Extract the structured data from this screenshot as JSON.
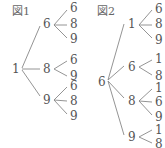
{
  "figures": [
    {
      "title": "図1",
      "root": "1",
      "branches": [
        {
          "value": "6",
          "leaves": [
            "6",
            "8",
            "9"
          ]
        },
        {
          "value": "8",
          "leaves": [
            "6",
            "9"
          ]
        },
        {
          "value": "9",
          "leaves": [
            "6",
            "8",
            "9"
          ]
        }
      ]
    },
    {
      "title": "図2",
      "root": "6",
      "branches": [
        {
          "value": "1",
          "leaves": [
            "6",
            "8",
            "9"
          ]
        },
        {
          "value": "6",
          "leaves": [
            "1",
            "8"
          ]
        },
        {
          "value": "8",
          "leaves": [
            "1",
            "6",
            "9"
          ]
        },
        {
          "value": "9",
          "leaves": [
            "1",
            "8"
          ]
        }
      ]
    }
  ],
  "colors": {
    "text": "#555555",
    "line": "#888888",
    "background": "#ffffff"
  }
}
